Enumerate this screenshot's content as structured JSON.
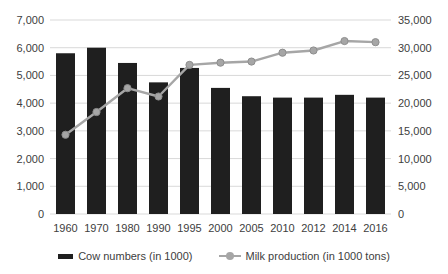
{
  "chart_data": {
    "type": "combo",
    "categories": [
      "1960",
      "1970",
      "1980",
      "1990",
      "1995",
      "2000",
      "2005",
      "2010",
      "2012",
      "2014",
      "2016"
    ],
    "series": [
      {
        "name": "Cow numbers (in 1000)",
        "type": "bar",
        "axis": "left",
        "color": "#1f1f1f",
        "values": [
          5800,
          6000,
          5450,
          4750,
          5270,
          4550,
          4250,
          4200,
          4200,
          4300,
          4200
        ]
      },
      {
        "name": "Milk production (in 1000 tons)",
        "type": "line",
        "axis": "right",
        "color": "#a6a6a6",
        "marker_edge_color": "#8e8e8e",
        "values": [
          14300,
          18400,
          22700,
          21200,
          26900,
          27300,
          27500,
          29100,
          29500,
          31200,
          31000
        ]
      }
    ],
    "left_axis": {
      "min": 0,
      "max": 7000,
      "step": 1000
    },
    "right_axis": {
      "min": 0,
      "max": 35000,
      "step": 5000
    },
    "grid": true,
    "gridline_color": "#d9d9d9",
    "text_color": "#404040",
    "legend_position": "bottom",
    "title": "",
    "xlabel": "",
    "ylabel": ""
  }
}
